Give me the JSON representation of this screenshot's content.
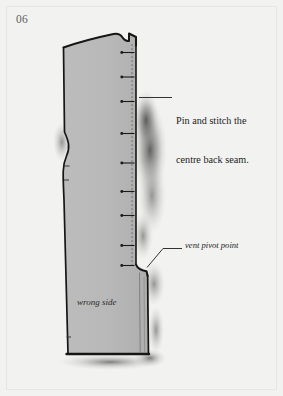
{
  "page": {
    "number": "06",
    "background_color": "#f2f2f0",
    "frame_color": "#e6e6e4"
  },
  "illustration": {
    "name": "garment-back-panel-pattern",
    "fabric_color": "#b9b9b9",
    "outline_color": "#161616",
    "seam_line_color": "#6d6d6d",
    "pin_color": "#1a1a1a",
    "shadow_color": "#4a4a4a",
    "pin_count": 9
  },
  "labels": {
    "wrong_side": "wrong side"
  },
  "callouts": [
    {
      "id": "seam",
      "line1": "Pin and stitch the",
      "line2": "centre back seam.",
      "style": "roman"
    },
    {
      "id": "vent",
      "text": "vent pivot point",
      "style": "italic"
    }
  ]
}
